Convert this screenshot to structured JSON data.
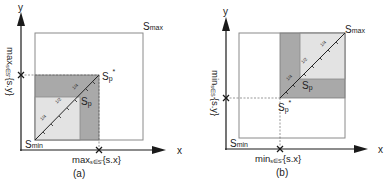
{
  "colors": {
    "axis": "#1a1a1a",
    "box_stroke": "#8a8a8a",
    "dark_region": "#a9a9a9",
    "light_region": "#e3e3e3",
    "diagonal": "#222222",
    "text": "#222222"
  },
  "panel_a": {
    "caption": "(a)",
    "axis_x_label": "x",
    "axis_y_label": "y",
    "smax_label_main": "S",
    "smax_label_sub": "max",
    "smin_label_main": "S",
    "smin_label_sub": "min",
    "sp_label_main": "S",
    "sp_label_sub": "p",
    "sp_star_label_main": "S",
    "sp_star_label_sub": "p",
    "sp_star_label_sup": "*",
    "x_marker_label_pre": "max",
    "x_marker_label_sub": "s∈S'",
    "x_marker_label_post": "{s.x}",
    "y_marker_label_pre": "max",
    "y_marker_label_sub": "s∈S'",
    "y_marker_label_post": "{s.y}",
    "tick_labels": [
      "1/4",
      "1/2",
      "1/4"
    ]
  },
  "panel_b": {
    "caption": "(b)",
    "axis_x_label": "x",
    "axis_y_label": "y",
    "smax_label_main": "S",
    "smax_label_sub": "max",
    "smin_label_main": "S",
    "smin_label_sub": "min",
    "sp_label_main": "S",
    "sp_label_sub": "p",
    "sp_star_label_main": "S",
    "sp_star_label_sub": "p",
    "sp_star_label_sup": "*",
    "x_marker_label_pre": "min",
    "x_marker_label_sub": "s∈S'",
    "x_marker_label_post": "{s.x}",
    "y_marker_label_pre": "min",
    "y_marker_label_sub": "s∈S'",
    "y_marker_label_post": "{s.y}",
    "tick_labels": [
      "1/4",
      "1/2",
      "1/4"
    ]
  }
}
